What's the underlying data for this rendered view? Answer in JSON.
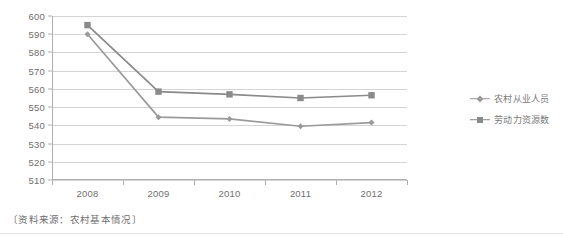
{
  "chart_data": {
    "type": "line",
    "title": "",
    "subtitle": "",
    "xlabel": "",
    "ylabel": "",
    "categories": [
      "2008",
      "2009",
      "2010",
      "2011",
      "2012"
    ],
    "x": [
      2008,
      2009,
      2010,
      2011,
      2012
    ],
    "ylim": [
      510,
      600
    ],
    "yticks": [
      510,
      520,
      530,
      540,
      550,
      560,
      570,
      580,
      590,
      600
    ],
    "ytick_labels": [
      "510",
      "520",
      "530",
      "540",
      "550",
      "560",
      "570",
      "580",
      "590",
      "600"
    ],
    "grid": true,
    "grid_axis": "y",
    "legend_position": "right",
    "series": [
      {
        "name": "农村从业人员",
        "marker": "diamond",
        "color": "#9a9a9a",
        "values": [
          590.0,
          544.5,
          543.5,
          539.5,
          541.5
        ]
      },
      {
        "name": "劳动力资源数",
        "marker": "square",
        "color": "#8a8a8a",
        "values": [
          595.0,
          558.5,
          557.0,
          555.0,
          556.5
        ]
      }
    ],
    "annotations": [
      "〔资料来源：农村基本情况〕"
    ]
  },
  "legend": {
    "items": [
      {
        "label": "农村从业人员",
        "marker": "diamond"
      },
      {
        "label": "劳动力资源数",
        "marker": "square"
      }
    ]
  },
  "footnote": {
    "text": "〔资料来源：农村基本情况〕"
  },
  "colors": {
    "series_1": "#9a9a9a",
    "series_2": "#8a8a8a",
    "grid": "#d4d4d4",
    "axis": "#b0b0b0",
    "text": "#6f6f6f",
    "background": "#ffffff"
  }
}
